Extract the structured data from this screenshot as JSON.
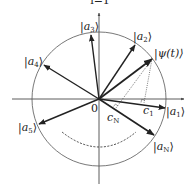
{
  "diagram": {
    "title_fragment": "i=1",
    "origin_label": "0",
    "axes": {
      "horizontal": "x-axis",
      "vertical": "y-axis"
    },
    "circle": {
      "description": "unit circle"
    },
    "vectors": [
      {
        "id": "a1",
        "label_bra": "|",
        "label_main": "a",
        "label_sub": "1",
        "label_ket": "⟩"
      },
      {
        "id": "a2",
        "label_bra": "|",
        "label_main": "a",
        "label_sub": "2",
        "label_ket": "⟩"
      },
      {
        "id": "a3",
        "label_bra": "|",
        "label_main": "a",
        "label_sub": "3",
        "label_ket": "⟩"
      },
      {
        "id": "a4",
        "label_bra": "|",
        "label_main": "a",
        "label_sub": "4",
        "label_ket": "⟩"
      },
      {
        "id": "a5",
        "label_bra": "|",
        "label_main": "a",
        "label_sub": "5",
        "label_ket": "⟩"
      },
      {
        "id": "aN",
        "label_bra": "|",
        "label_main": "a",
        "label_sub": "N",
        "label_ket": "⟩"
      },
      {
        "id": "psi",
        "label": "|ψ(t)⟩"
      }
    ],
    "projections": [
      {
        "id": "c1",
        "label_main": "c",
        "label_sub": "1"
      },
      {
        "id": "cN",
        "label_main": "c",
        "label_sub": "N"
      }
    ],
    "ellipsis_arc": "dashed arc indicating more vectors"
  }
}
